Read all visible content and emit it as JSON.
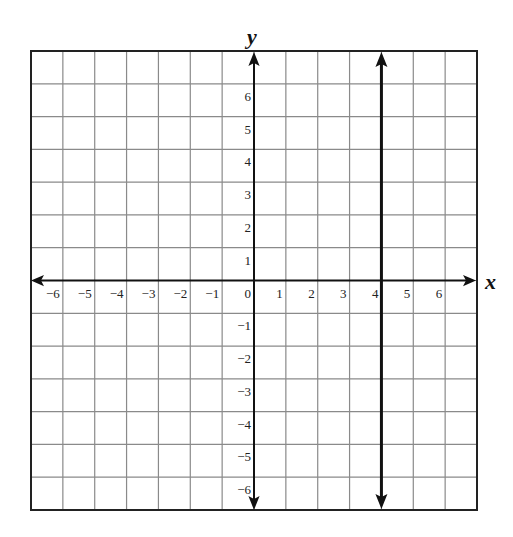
{
  "diagram": {
    "type": "coordinate-plane",
    "axes": {
      "x_label": "x",
      "y_label": "y",
      "x_range": [
        -7,
        7
      ],
      "y_range": [
        -7,
        7
      ],
      "x_ticks": [
        "−6",
        "−5",
        "−4",
        "−3",
        "−2",
        "−1",
        "0",
        "1",
        "2",
        "3",
        "4",
        "5",
        "6"
      ],
      "y_ticks": [
        "6",
        "5",
        "4",
        "3",
        "2",
        "1",
        "−1",
        "−2",
        "−3",
        "−4",
        "−5",
        "−6"
      ]
    },
    "grid": {
      "columns": 14,
      "rows": 14,
      "color": "#8a8a8a",
      "border_color": "#222222"
    },
    "lines": [
      {
        "kind": "vertical",
        "equation": "x = 4",
        "x": 4,
        "color": "#111111",
        "arrows": "both"
      }
    ]
  },
  "chart_data": {
    "type": "line",
    "title": "",
    "xlabel": "x",
    "ylabel": "y",
    "xlim": [
      -7,
      7
    ],
    "ylim": [
      -7,
      7
    ],
    "grid": true,
    "series": [
      {
        "name": "x = 4",
        "x": [
          4,
          4
        ],
        "y": [
          -7,
          7
        ]
      }
    ]
  }
}
